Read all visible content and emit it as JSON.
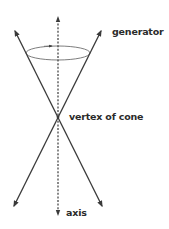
{
  "diagram": {
    "labels": {
      "generator": "generator",
      "vertex": "vertex of cone",
      "axis": "axis"
    },
    "colors": {
      "line": "#3a3a3a",
      "ellipse": "#6e6e6e",
      "text": "#2b2b2b",
      "background": "#ffffff"
    }
  }
}
